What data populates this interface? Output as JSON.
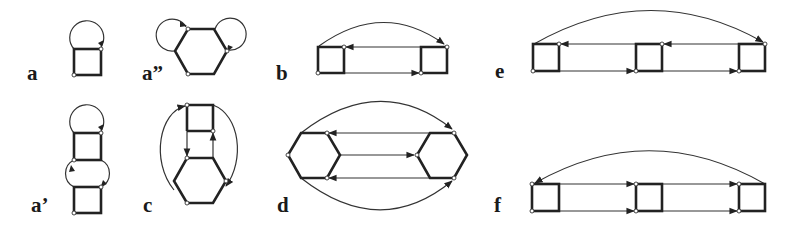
{
  "figure": {
    "panels": [
      {
        "id": "a",
        "label": "a",
        "shapes": [
          "square"
        ],
        "loops": 1
      },
      {
        "id": "a2",
        "label": "a”",
        "shapes": [
          "hexagon"
        ],
        "loops": 2
      },
      {
        "id": "b",
        "label": "b",
        "shapes": [
          "square",
          "square"
        ],
        "directed_edges": 2,
        "arcs": 1
      },
      {
        "id": "e",
        "label": "e",
        "shapes": [
          "square",
          "square",
          "square"
        ],
        "directed_edges": 4,
        "arcs": 1
      },
      {
        "id": "a1",
        "label": "a’",
        "shapes": [
          "square",
          "square"
        ],
        "loops": 2
      },
      {
        "id": "c",
        "label": "c",
        "shapes": [
          "square",
          "hexagon"
        ],
        "directed_edges": 2,
        "arcs": 2
      },
      {
        "id": "d",
        "label": "d",
        "shapes": [
          "hexagon",
          "hexagon"
        ],
        "directed_edges": 3,
        "arcs": 2
      },
      {
        "id": "f",
        "label": "f",
        "shapes": [
          "square",
          "square",
          "square"
        ],
        "directed_edges": 4,
        "arcs": 1
      }
    ]
  },
  "colors": {
    "line": "#222222",
    "background": "#ffffff",
    "node_fill": "#ffffff"
  }
}
